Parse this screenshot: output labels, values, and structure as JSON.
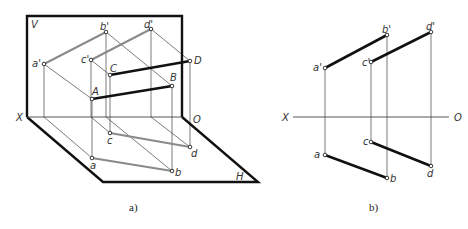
{
  "figure_a": {
    "caption": "a)",
    "plane_labels": {
      "V": "V",
      "H": "H",
      "X": "X",
      "O": "O"
    },
    "points": {
      "a_prime": "a'",
      "b_prime": "b'",
      "c_prime": "c'",
      "d_prime": "d'",
      "A": "A",
      "B": "B",
      "C": "C",
      "D": "D",
      "a": "a",
      "b": "b",
      "c": "c",
      "d": "d"
    }
  },
  "figure_b": {
    "caption": "b)",
    "axis_labels": {
      "X": "X",
      "O": "O"
    },
    "points": {
      "a_prime": "a'",
      "b_prime": "b'",
      "c_prime": "c'",
      "d_prime": "d'",
      "a": "a",
      "b": "b",
      "c": "c",
      "d": "d"
    }
  },
  "colors": {
    "frame": "#111111",
    "main_line": "#111111",
    "projection_line_a": "#8a8a8a",
    "thin_line": "#444444"
  }
}
